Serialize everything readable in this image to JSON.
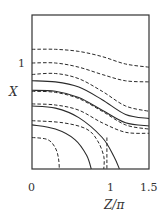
{
  "chart_data": {
    "type": "line",
    "title": "",
    "xlabel": "Z/π",
    "ylabel": "X",
    "xlim": [
      0,
      1.5
    ],
    "ylim": [
      0,
      1.47
    ],
    "x_ticks": [
      "0",
      "1",
      "1.5"
    ],
    "y_ticks": [
      "1"
    ],
    "grid": false,
    "legend": null,
    "series": [
      {
        "name": "dashed-1",
        "style": "dashed",
        "x": [
          0,
          0.3,
          0.6,
          0.9,
          1.2,
          1.5
        ],
        "y": [
          1.14,
          1.14,
          1.12,
          1.07,
          1.0,
          0.97
        ]
      },
      {
        "name": "dashed-2",
        "style": "dashed",
        "x": [
          0,
          0.3,
          0.6,
          0.9,
          1.2,
          1.5
        ],
        "y": [
          1.01,
          1.01,
          0.97,
          0.9,
          0.84,
          0.83
        ]
      },
      {
        "name": "dashed-3",
        "style": "dashed",
        "x": [
          0,
          0.3,
          0.6,
          0.9,
          1.2,
          1.5
        ],
        "y": [
          0.9,
          0.91,
          0.86,
          0.74,
          0.6,
          0.55
        ]
      },
      {
        "name": "solid-1",
        "style": "solid",
        "x": [
          0,
          0.3,
          0.6,
          0.9,
          1.2,
          1.5
        ],
        "y": [
          0.84,
          0.83,
          0.78,
          0.66,
          0.52,
          0.48
        ]
      },
      {
        "name": "solid-2",
        "style": "solid",
        "x": [
          0,
          0.3,
          0.6,
          0.9,
          1.2,
          1.5
        ],
        "y": [
          0.75,
          0.74,
          0.68,
          0.56,
          0.44,
          0.41
        ]
      },
      {
        "name": "dashed-4",
        "style": "dashed",
        "x": [
          0,
          0.3,
          0.6,
          0.9,
          1.2,
          1.5
        ],
        "y": [
          0.74,
          0.73,
          0.67,
          0.55,
          0.42,
          0.38
        ]
      },
      {
        "name": "dashed-5",
        "style": "dashed",
        "x": [
          0,
          0.3,
          0.6,
          0.9,
          1.2,
          1.5
        ],
        "y": [
          0.62,
          0.61,
          0.56,
          0.44,
          0.35,
          0.34
        ]
      },
      {
        "name": "solid-3",
        "style": "solid",
        "x": [
          0,
          0.3,
          0.6,
          0.9,
          1.05,
          1.12
        ],
        "y": [
          0.6,
          0.58,
          0.49,
          0.3,
          0.12,
          0
        ]
      },
      {
        "name": "dashed-6",
        "style": "dashed",
        "x": [
          0,
          0.4,
          0.7,
          0.84,
          0.92,
          0.92
        ],
        "y": [
          0.46,
          0.44,
          0.38,
          0.27,
          0.12,
          0
        ]
      },
      {
        "name": "solid-4",
        "style": "solid",
        "x": [
          0,
          0.3,
          0.55,
          0.7,
          0.76
        ],
        "y": [
          0.42,
          0.38,
          0.28,
          0.13,
          0
        ]
      },
      {
        "name": "dashed-7",
        "style": "dashed",
        "x": [
          0,
          0.2,
          0.3,
          0.34,
          0.35
        ],
        "y": [
          0.3,
          0.28,
          0.2,
          0.1,
          0
        ]
      },
      {
        "name": "dashed-8",
        "style": "dashed",
        "x": [
          0.96,
          0.96
        ],
        "y": [
          0.3,
          0
        ]
      }
    ]
  },
  "axes": {
    "x_tick_0": "0",
    "x_tick_1": "1",
    "x_tick_15": "1.5",
    "y_tick_1": "1",
    "xlabel": "Z/π",
    "ylabel": "X"
  }
}
